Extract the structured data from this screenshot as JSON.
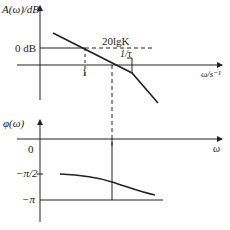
{
  "magnitude_plot": {
    "y_axis_label": "A(ω)/dB",
    "x_axis_label": "ω/s⁻¹",
    "zero_db_label": "0 dB",
    "tick_one_label": "1",
    "gain_label": "20lgK",
    "corner_label": "1/τ"
  },
  "phase_plot": {
    "y_axis_label": "φ(ω)",
    "x_axis_label": "ω",
    "zero_label": "0",
    "half_pi_label": "−π/2",
    "pi_label": "−π"
  },
  "colors": {
    "line": "#222222",
    "background": "#ffffff"
  }
}
